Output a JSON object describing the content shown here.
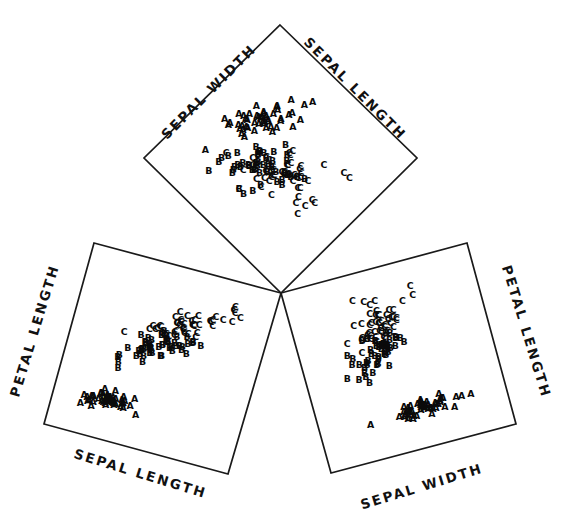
{
  "figure": {
    "title": "",
    "background": "#ffffff",
    "ink_color": "#111111",
    "width": 564,
    "height": 515
  },
  "panels": [
    {
      "id": "top",
      "name": "sepal-width-vs-sepal-length",
      "xlabel": "SEPAL WIDTH",
      "ylabel": "SEPAL LENGTH",
      "xlabel_rotation": -45,
      "ylabel_rotation": 45,
      "frame": [
        [
          280,
          25
        ],
        [
          417,
          158
        ],
        [
          281,
          293
        ],
        [
          144,
          158
        ]
      ]
    },
    {
      "id": "left",
      "name": "sepal-length-vs-petal-length",
      "xlabel": "SEPAL LENGTH",
      "ylabel": "PETAL LENGTH",
      "xlabel_rotation": 17,
      "ylabel_rotation": -73,
      "frame": [
        [
          94,
          243
        ],
        [
          281,
          293
        ],
        [
          228,
          474
        ],
        [
          44,
          424
        ]
      ]
    },
    {
      "id": "right",
      "name": "sepal-width-vs-petal-length",
      "xlabel": "SEPAL WIDTH",
      "ylabel": "PETAL LENGTH",
      "xlabel_rotation": -17,
      "ylabel_rotation": 73,
      "frame": [
        [
          281,
          293
        ],
        [
          467,
          243
        ],
        [
          516,
          424
        ],
        [
          331,
          473
        ]
      ]
    }
  ],
  "legend": {
    "marker_labels": [
      "A",
      "B",
      "C"
    ],
    "note": "Plot characters A, B, C denote the three iris species groups"
  },
  "chart_data": {
    "type": "scatter",
    "title": "",
    "xlabel": "",
    "ylabel": "",
    "variables": [
      "SEPAL LENGTH",
      "SEPAL WIDTH",
      "PETAL LENGTH"
    ],
    "group_codes": [
      "A",
      "B",
      "C"
    ],
    "axis_ranges": {
      "SEPAL LENGTH": [
        4.3,
        7.9
      ],
      "SEPAL WIDTH": [
        2.0,
        4.4
      ],
      "PETAL LENGTH": [
        1.0,
        6.9
      ]
    },
    "grid": false,
    "legend_position": "none",
    "points": [
      {
        "g": "A",
        "sl": 5.1,
        "sw": 3.5,
        "pl": 1.4
      },
      {
        "g": "A",
        "sl": 4.9,
        "sw": 3.0,
        "pl": 1.4
      },
      {
        "g": "A",
        "sl": 4.7,
        "sw": 3.2,
        "pl": 1.3
      },
      {
        "g": "A",
        "sl": 4.6,
        "sw": 3.1,
        "pl": 1.5
      },
      {
        "g": "A",
        "sl": 5.0,
        "sw": 3.6,
        "pl": 1.4
      },
      {
        "g": "A",
        "sl": 5.4,
        "sw": 3.9,
        "pl": 1.7
      },
      {
        "g": "A",
        "sl": 4.6,
        "sw": 3.4,
        "pl": 1.4
      },
      {
        "g": "A",
        "sl": 5.0,
        "sw": 3.4,
        "pl": 1.5
      },
      {
        "g": "A",
        "sl": 4.4,
        "sw": 2.9,
        "pl": 1.4
      },
      {
        "g": "A",
        "sl": 4.9,
        "sw": 3.1,
        "pl": 1.5
      },
      {
        "g": "A",
        "sl": 5.4,
        "sw": 3.7,
        "pl": 1.5
      },
      {
        "g": "A",
        "sl": 4.8,
        "sw": 3.4,
        "pl": 1.6
      },
      {
        "g": "A",
        "sl": 4.8,
        "sw": 3.0,
        "pl": 1.4
      },
      {
        "g": "A",
        "sl": 4.3,
        "sw": 3.0,
        "pl": 1.1
      },
      {
        "g": "A",
        "sl": 5.8,
        "sw": 4.0,
        "pl": 1.2
      },
      {
        "g": "A",
        "sl": 5.7,
        "sw": 4.4,
        "pl": 1.5
      },
      {
        "g": "A",
        "sl": 5.4,
        "sw": 3.9,
        "pl": 1.3
      },
      {
        "g": "A",
        "sl": 5.1,
        "sw": 3.5,
        "pl": 1.4
      },
      {
        "g": "A",
        "sl": 5.7,
        "sw": 3.8,
        "pl": 1.7
      },
      {
        "g": "A",
        "sl": 5.1,
        "sw": 3.8,
        "pl": 1.5
      },
      {
        "g": "A",
        "sl": 5.4,
        "sw": 3.4,
        "pl": 1.7
      },
      {
        "g": "A",
        "sl": 5.1,
        "sw": 3.7,
        "pl": 1.5
      },
      {
        "g": "A",
        "sl": 4.6,
        "sw": 3.6,
        "pl": 1.0
      },
      {
        "g": "A",
        "sl": 5.1,
        "sw": 3.3,
        "pl": 1.7
      },
      {
        "g": "A",
        "sl": 4.8,
        "sw": 3.4,
        "pl": 1.9
      },
      {
        "g": "A",
        "sl": 5.0,
        "sw": 3.0,
        "pl": 1.6
      },
      {
        "g": "A",
        "sl": 5.0,
        "sw": 3.4,
        "pl": 1.6
      },
      {
        "g": "A",
        "sl": 5.2,
        "sw": 3.5,
        "pl": 1.5
      },
      {
        "g": "A",
        "sl": 5.2,
        "sw": 3.4,
        "pl": 1.4
      },
      {
        "g": "A",
        "sl": 4.7,
        "sw": 3.2,
        "pl": 1.6
      },
      {
        "g": "A",
        "sl": 4.8,
        "sw": 3.1,
        "pl": 1.6
      },
      {
        "g": "A",
        "sl": 5.4,
        "sw": 3.4,
        "pl": 1.5
      },
      {
        "g": "A",
        "sl": 5.2,
        "sw": 4.1,
        "pl": 1.5
      },
      {
        "g": "A",
        "sl": 5.5,
        "sw": 4.2,
        "pl": 1.4
      },
      {
        "g": "A",
        "sl": 4.9,
        "sw": 3.1,
        "pl": 1.5
      },
      {
        "g": "A",
        "sl": 5.0,
        "sw": 3.2,
        "pl": 1.2
      },
      {
        "g": "A",
        "sl": 5.5,
        "sw": 3.5,
        "pl": 1.3
      },
      {
        "g": "A",
        "sl": 4.9,
        "sw": 3.6,
        "pl": 1.4
      },
      {
        "g": "A",
        "sl": 4.4,
        "sw": 3.0,
        "pl": 1.3
      },
      {
        "g": "A",
        "sl": 5.1,
        "sw": 3.4,
        "pl": 1.5
      },
      {
        "g": "A",
        "sl": 5.0,
        "sw": 3.5,
        "pl": 1.3
      },
      {
        "g": "A",
        "sl": 4.5,
        "sw": 2.3,
        "pl": 1.3
      },
      {
        "g": "A",
        "sl": 4.4,
        "sw": 3.2,
        "pl": 1.3
      },
      {
        "g": "A",
        "sl": 5.0,
        "sw": 3.5,
        "pl": 1.6
      },
      {
        "g": "A",
        "sl": 5.1,
        "sw": 3.8,
        "pl": 1.9
      },
      {
        "g": "A",
        "sl": 4.8,
        "sw": 3.0,
        "pl": 1.4
      },
      {
        "g": "A",
        "sl": 5.1,
        "sw": 3.8,
        "pl": 1.6
      },
      {
        "g": "A",
        "sl": 4.6,
        "sw": 3.2,
        "pl": 1.4
      },
      {
        "g": "A",
        "sl": 5.3,
        "sw": 3.7,
        "pl": 1.5
      },
      {
        "g": "A",
        "sl": 5.0,
        "sw": 3.3,
        "pl": 1.4
      },
      {
        "g": "B",
        "sl": 7.0,
        "sw": 3.2,
        "pl": 4.7
      },
      {
        "g": "B",
        "sl": 6.4,
        "sw": 3.2,
        "pl": 4.5
      },
      {
        "g": "B",
        "sl": 6.9,
        "sw": 3.1,
        "pl": 4.9
      },
      {
        "g": "B",
        "sl": 5.5,
        "sw": 2.3,
        "pl": 4.0
      },
      {
        "g": "B",
        "sl": 6.5,
        "sw": 2.8,
        "pl": 4.6
      },
      {
        "g": "B",
        "sl": 5.7,
        "sw": 2.8,
        "pl": 4.5
      },
      {
        "g": "B",
        "sl": 6.3,
        "sw": 3.3,
        "pl": 4.7
      },
      {
        "g": "B",
        "sl": 4.9,
        "sw": 2.4,
        "pl": 3.3
      },
      {
        "g": "B",
        "sl": 6.6,
        "sw": 2.9,
        "pl": 4.6
      },
      {
        "g": "B",
        "sl": 5.2,
        "sw": 2.7,
        "pl": 3.9
      },
      {
        "g": "B",
        "sl": 5.0,
        "sw": 2.0,
        "pl": 3.5
      },
      {
        "g": "B",
        "sl": 5.9,
        "sw": 3.0,
        "pl": 4.2
      },
      {
        "g": "B",
        "sl": 6.0,
        "sw": 2.2,
        "pl": 4.0
      },
      {
        "g": "B",
        "sl": 6.1,
        "sw": 2.9,
        "pl": 4.7
      },
      {
        "g": "B",
        "sl": 5.6,
        "sw": 2.9,
        "pl": 3.6
      },
      {
        "g": "B",
        "sl": 6.7,
        "sw": 3.1,
        "pl": 4.4
      },
      {
        "g": "B",
        "sl": 5.6,
        "sw": 3.0,
        "pl": 4.5
      },
      {
        "g": "B",
        "sl": 5.8,
        "sw": 2.7,
        "pl": 4.1
      },
      {
        "g": "B",
        "sl": 6.2,
        "sw": 2.2,
        "pl": 4.5
      },
      {
        "g": "B",
        "sl": 5.6,
        "sw": 2.5,
        "pl": 3.9
      },
      {
        "g": "B",
        "sl": 5.9,
        "sw": 3.2,
        "pl": 4.8
      },
      {
        "g": "B",
        "sl": 6.1,
        "sw": 2.8,
        "pl": 4.0
      },
      {
        "g": "B",
        "sl": 6.3,
        "sw": 2.5,
        "pl": 4.9
      },
      {
        "g": "B",
        "sl": 6.1,
        "sw": 2.8,
        "pl": 4.7
      },
      {
        "g": "B",
        "sl": 6.4,
        "sw": 2.9,
        "pl": 4.3
      },
      {
        "g": "B",
        "sl": 6.6,
        "sw": 3.0,
        "pl": 4.4
      },
      {
        "g": "B",
        "sl": 6.8,
        "sw": 2.8,
        "pl": 4.8
      },
      {
        "g": "B",
        "sl": 6.7,
        "sw": 3.0,
        "pl": 5.0
      },
      {
        "g": "B",
        "sl": 6.0,
        "sw": 2.9,
        "pl": 4.5
      },
      {
        "g": "B",
        "sl": 5.7,
        "sw": 2.6,
        "pl": 3.5
      },
      {
        "g": "B",
        "sl": 5.5,
        "sw": 2.4,
        "pl": 3.8
      },
      {
        "g": "B",
        "sl": 5.5,
        "sw": 2.4,
        "pl": 3.7
      },
      {
        "g": "B",
        "sl": 5.8,
        "sw": 2.7,
        "pl": 3.9
      },
      {
        "g": "B",
        "sl": 6.0,
        "sw": 2.7,
        "pl": 5.1
      },
      {
        "g": "B",
        "sl": 5.4,
        "sw": 3.0,
        "pl": 4.5
      },
      {
        "g": "B",
        "sl": 6.0,
        "sw": 3.4,
        "pl": 4.5
      },
      {
        "g": "B",
        "sl": 6.7,
        "sw": 3.1,
        "pl": 4.7
      },
      {
        "g": "B",
        "sl": 6.3,
        "sw": 2.3,
        "pl": 4.4
      },
      {
        "g": "B",
        "sl": 5.6,
        "sw": 3.0,
        "pl": 4.1
      },
      {
        "g": "B",
        "sl": 5.5,
        "sw": 2.5,
        "pl": 4.0
      },
      {
        "g": "B",
        "sl": 5.5,
        "sw": 2.6,
        "pl": 4.4
      },
      {
        "g": "B",
        "sl": 6.1,
        "sw": 3.0,
        "pl": 4.6
      },
      {
        "g": "B",
        "sl": 5.8,
        "sw": 2.6,
        "pl": 4.0
      },
      {
        "g": "B",
        "sl": 5.0,
        "sw": 2.3,
        "pl": 3.3
      },
      {
        "g": "B",
        "sl": 5.6,
        "sw": 2.7,
        "pl": 4.2
      },
      {
        "g": "B",
        "sl": 5.7,
        "sw": 3.0,
        "pl": 4.2
      },
      {
        "g": "B",
        "sl": 5.7,
        "sw": 2.9,
        "pl": 4.2
      },
      {
        "g": "B",
        "sl": 6.2,
        "sw": 2.9,
        "pl": 4.3
      },
      {
        "g": "B",
        "sl": 5.1,
        "sw": 2.5,
        "pl": 3.0
      },
      {
        "g": "B",
        "sl": 5.7,
        "sw": 2.8,
        "pl": 4.1
      },
      {
        "g": "C",
        "sl": 6.3,
        "sw": 3.3,
        "pl": 6.0
      },
      {
        "g": "C",
        "sl": 5.8,
        "sw": 2.7,
        "pl": 5.1
      },
      {
        "g": "C",
        "sl": 7.1,
        "sw": 3.0,
        "pl": 5.9
      },
      {
        "g": "C",
        "sl": 6.3,
        "sw": 2.9,
        "pl": 5.6
      },
      {
        "g": "C",
        "sl": 6.5,
        "sw": 3.0,
        "pl": 5.8
      },
      {
        "g": "C",
        "sl": 7.6,
        "sw": 3.0,
        "pl": 6.6
      },
      {
        "g": "C",
        "sl": 4.9,
        "sw": 2.5,
        "pl": 4.5
      },
      {
        "g": "C",
        "sl": 7.3,
        "sw": 2.9,
        "pl": 6.3
      },
      {
        "g": "C",
        "sl": 6.7,
        "sw": 2.5,
        "pl": 5.8
      },
      {
        "g": "C",
        "sl": 7.2,
        "sw": 3.6,
        "pl": 6.1
      },
      {
        "g": "C",
        "sl": 6.5,
        "sw": 3.2,
        "pl": 5.1
      },
      {
        "g": "C",
        "sl": 6.4,
        "sw": 2.7,
        "pl": 5.3
      },
      {
        "g": "C",
        "sl": 6.8,
        "sw": 3.0,
        "pl": 5.5
      },
      {
        "g": "C",
        "sl": 5.7,
        "sw": 2.5,
        "pl": 5.0
      },
      {
        "g": "C",
        "sl": 5.8,
        "sw": 2.8,
        "pl": 5.1
      },
      {
        "g": "C",
        "sl": 6.4,
        "sw": 3.2,
        "pl": 5.3
      },
      {
        "g": "C",
        "sl": 6.5,
        "sw": 3.0,
        "pl": 5.5
      },
      {
        "g": "C",
        "sl": 7.7,
        "sw": 3.8,
        "pl": 6.7
      },
      {
        "g": "C",
        "sl": 7.7,
        "sw": 2.6,
        "pl": 6.9
      },
      {
        "g": "C",
        "sl": 6.0,
        "sw": 2.2,
        "pl": 5.0
      },
      {
        "g": "C",
        "sl": 6.9,
        "sw": 3.2,
        "pl": 5.7
      },
      {
        "g": "C",
        "sl": 5.6,
        "sw": 2.8,
        "pl": 4.9
      },
      {
        "g": "C",
        "sl": 7.7,
        "sw": 2.8,
        "pl": 6.7
      },
      {
        "g": "C",
        "sl": 6.3,
        "sw": 2.7,
        "pl": 4.9
      },
      {
        "g": "C",
        "sl": 6.7,
        "sw": 3.3,
        "pl": 5.7
      },
      {
        "g": "C",
        "sl": 7.2,
        "sw": 3.2,
        "pl": 6.0
      },
      {
        "g": "C",
        "sl": 6.2,
        "sw": 2.8,
        "pl": 4.8
      },
      {
        "g": "C",
        "sl": 6.1,
        "sw": 3.0,
        "pl": 4.9
      },
      {
        "g": "C",
        "sl": 6.4,
        "sw": 2.8,
        "pl": 5.6
      },
      {
        "g": "C",
        "sl": 7.2,
        "sw": 3.0,
        "pl": 5.8
      },
      {
        "g": "C",
        "sl": 7.4,
        "sw": 2.8,
        "pl": 6.1
      },
      {
        "g": "C",
        "sl": 7.9,
        "sw": 3.8,
        "pl": 6.4
      },
      {
        "g": "C",
        "sl": 6.4,
        "sw": 2.8,
        "pl": 5.6
      },
      {
        "g": "C",
        "sl": 6.3,
        "sw": 2.8,
        "pl": 5.1
      },
      {
        "g": "C",
        "sl": 6.1,
        "sw": 2.6,
        "pl": 5.6
      },
      {
        "g": "C",
        "sl": 7.7,
        "sw": 3.0,
        "pl": 6.1
      },
      {
        "g": "C",
        "sl": 6.3,
        "sw": 3.4,
        "pl": 5.6
      },
      {
        "g": "C",
        "sl": 6.4,
        "sw": 3.1,
        "pl": 5.5
      },
      {
        "g": "C",
        "sl": 6.0,
        "sw": 3.0,
        "pl": 4.8
      },
      {
        "g": "C",
        "sl": 6.9,
        "sw": 3.1,
        "pl": 5.4
      },
      {
        "g": "C",
        "sl": 6.7,
        "sw": 3.1,
        "pl": 5.6
      },
      {
        "g": "C",
        "sl": 6.9,
        "sw": 3.1,
        "pl": 5.1
      },
      {
        "g": "C",
        "sl": 5.8,
        "sw": 2.7,
        "pl": 5.1
      },
      {
        "g": "C",
        "sl": 6.8,
        "sw": 3.2,
        "pl": 5.9
      },
      {
        "g": "C",
        "sl": 6.7,
        "sw": 3.3,
        "pl": 5.7
      },
      {
        "g": "C",
        "sl": 6.7,
        "sw": 3.0,
        "pl": 5.2
      },
      {
        "g": "C",
        "sl": 6.3,
        "sw": 2.5,
        "pl": 5.0
      },
      {
        "g": "C",
        "sl": 6.5,
        "sw": 3.0,
        "pl": 5.2
      },
      {
        "g": "C",
        "sl": 6.2,
        "sw": 3.4,
        "pl": 5.4
      },
      {
        "g": "C",
        "sl": 5.9,
        "sw": 3.0,
        "pl": 5.1
      }
    ]
  }
}
